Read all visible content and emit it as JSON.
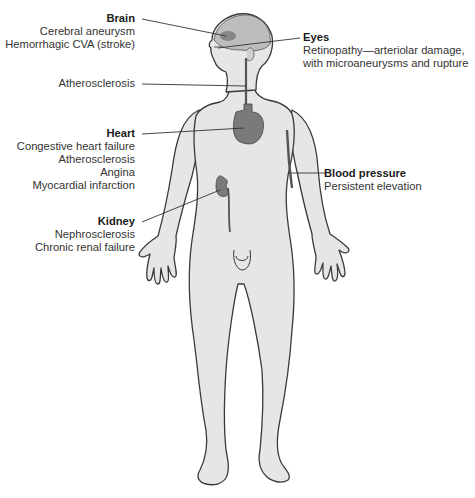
{
  "figure": {
    "colors": {
      "body_fill": "#e6e6e6",
      "body_outline": "#3a3a3a",
      "organ_fill": "#7a7a7a",
      "brain_fill": "#bdbdbd",
      "leader_line": "#333333",
      "text": "#2a2a2a"
    }
  },
  "labels": {
    "brain": {
      "title": "Brain",
      "items": [
        "Cerebral aneurysm",
        "Hemorrhagic CVA (stroke)"
      ]
    },
    "eyes": {
      "title": "Eyes",
      "items": [
        "Retinopathy—arteriolar damage,",
        "with microaneurysms and rupture"
      ]
    },
    "vessels": {
      "title": "",
      "items": [
        "Atherosclerosis"
      ]
    },
    "heart": {
      "title": "Heart",
      "items": [
        "Congestive heart failure",
        "Atherosclerosis",
        "Angina",
        "Myocardial infarction"
      ]
    },
    "blood_pressure": {
      "title": "Blood pressure",
      "items": [
        "Persistent elevation"
      ]
    },
    "kidney": {
      "title": "Kidney",
      "items": [
        "Nephrosclerosis",
        "Chronic renal failure"
      ]
    }
  }
}
